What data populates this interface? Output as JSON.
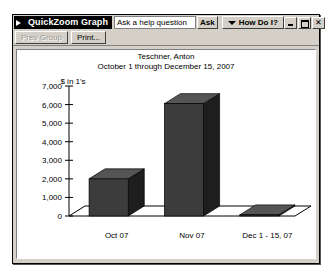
{
  "window": {
    "title": "QuickZoom Graph",
    "app_icon": "app-arrow-icon",
    "help_placeholder": "Ask a help question",
    "ask_label": "Ask",
    "howdoi_label": "How Do I?",
    "minimize_label": "_",
    "maximize_label": "□",
    "close_label": "✕"
  },
  "toolbar": {
    "prev_group_label": "Prev Group",
    "print_label": "Print..."
  },
  "chart_data": {
    "type": "bar",
    "title": "Teschner, Anton",
    "subtitle": "October 1 through December 15, 2007",
    "ylabel": "$ in 1's",
    "xlabel": "",
    "categories": [
      "Oct 07",
      "Nov 07",
      "Dec 1 - 15, 07"
    ],
    "values": [
      2000,
      6050,
      60
    ],
    "ylim": [
      0,
      7000
    ],
    "yticks": [
      0,
      1000,
      2000,
      3000,
      4000,
      5000,
      6000,
      7000
    ],
    "ytick_labels": [
      "0",
      "1,000",
      "2,000",
      "3,000",
      "4,000",
      "5,000",
      "6,000",
      "7,000"
    ],
    "grid": false,
    "legend": "none",
    "bar_color": "#3c3c3c",
    "bar_top_color": "#555555",
    "bar_side_color": "#1e1e1e",
    "floor_color": "#ffffff",
    "axis_color": "#000000",
    "style": "3d-column"
  }
}
